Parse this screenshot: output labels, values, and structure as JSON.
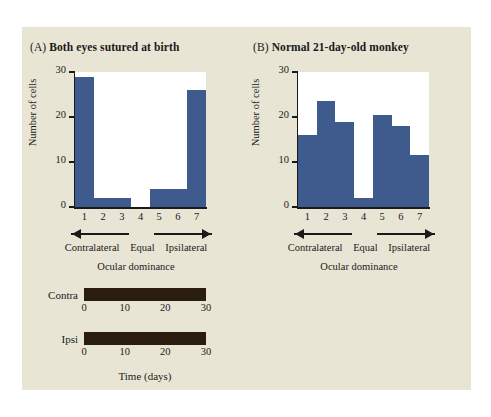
{
  "figure": {
    "background_color": "#e9e5d4",
    "page_color": "#ffffff",
    "bar_color": "#3f5b8e",
    "timeline_bar_color": "#2a1d10",
    "axis_color": "#1a1a1a"
  },
  "panels": [
    {
      "tag": "(A)",
      "title": "Both eyes sutured at birth",
      "ylabel": "Number of cells",
      "xlabel": "Ocular dominance",
      "x_tick_labels": [
        "1",
        "2",
        "3",
        "4",
        "5",
        "6",
        "7"
      ],
      "y_tick_labels": [
        "0",
        "10",
        "20",
        "30"
      ],
      "annotations": {
        "left": "Contralateral",
        "center": "Equal",
        "right": "Ipsilateral",
        "left_arrow": "left-arrow-icon",
        "right_arrow": "right-arrow-icon"
      }
    },
    {
      "tag": "(B)",
      "title": "Normal 21-day-old monkey",
      "ylabel": "Number of cells",
      "xlabel": "Ocular dominance",
      "x_tick_labels": [
        "1",
        "2",
        "3",
        "4",
        "5",
        "6",
        "7"
      ],
      "y_tick_labels": [
        "0",
        "10",
        "20",
        "30"
      ],
      "annotations": {
        "left": "Contralateral",
        "center": "Equal",
        "right": "Ipsilateral",
        "left_arrow": "left-arrow-icon",
        "right_arrow": "right-arrow-icon"
      }
    }
  ],
  "timeline": {
    "axis_title": "Time (days)",
    "tick_labels": [
      "0",
      "10",
      "20",
      "30"
    ],
    "tick_values": [
      0,
      10,
      20,
      30
    ],
    "axis_max": 30,
    "rows": [
      {
        "label": "Contra",
        "start": 0,
        "end": 30
      },
      {
        "label": "Ipsi",
        "start": 0,
        "end": 30
      }
    ]
  },
  "chart_data": [
    {
      "type": "bar",
      "panel": "A",
      "title": "Both eyes sutured at birth",
      "categories": [
        "1",
        "2",
        "3",
        "4",
        "5",
        "6",
        "7"
      ],
      "values": [
        29,
        2,
        2,
        0,
        4,
        4,
        26
      ],
      "xlabel": "Ocular dominance",
      "ylabel": "Number of cells",
      "ylim": [
        0,
        30
      ],
      "yticks": [
        0,
        10,
        20,
        30
      ],
      "grid": false,
      "legend": "none",
      "annotations": [
        "Contralateral",
        "Equal",
        "Ipsilateral"
      ]
    },
    {
      "type": "bar",
      "panel": "B",
      "title": "Normal 21-day-old monkey",
      "categories": [
        "1",
        "2",
        "3",
        "4",
        "5",
        "6",
        "7"
      ],
      "values": [
        16,
        23.5,
        19,
        2,
        20.5,
        18,
        11.5
      ],
      "xlabel": "Ocular dominance",
      "ylabel": "Number of cells",
      "ylim": [
        0,
        30
      ],
      "yticks": [
        0,
        10,
        20,
        30
      ],
      "grid": false,
      "legend": "none",
      "annotations": [
        "Contralateral",
        "Equal",
        "Ipsilateral"
      ]
    },
    {
      "type": "bar",
      "panel": "timeline",
      "orientation": "horizontal",
      "categories": [
        "Contra",
        "Ipsi"
      ],
      "values": [
        30,
        30
      ],
      "xlabel": "Time (days)",
      "ylabel": "",
      "xlim": [
        0,
        30
      ],
      "xticks": [
        0,
        10,
        20,
        30
      ],
      "grid": false,
      "legend": "none"
    }
  ]
}
